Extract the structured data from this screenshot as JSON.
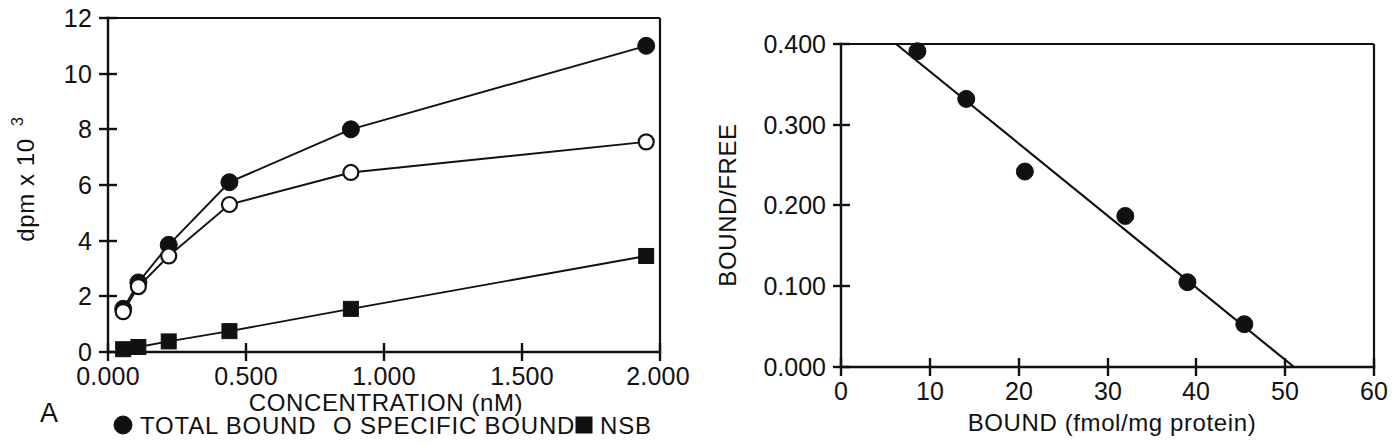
{
  "figure": {
    "panels": [
      {
        "letter": "A"
      },
      {
        "letter": "B"
      }
    ]
  },
  "panel_a": {
    "letter": "A",
    "axis": {
      "ylabel_main": "dpm x 10",
      "ylabel_sup": "3",
      "xlabel": "CONCENTRATION (nM)",
      "xticks": [
        "0.000",
        "0.500",
        "1.000",
        "1.500",
        "2.000"
      ],
      "yticks": [
        "0",
        "2",
        "4",
        "6",
        "8",
        "10",
        "12"
      ]
    },
    "legend": [
      {
        "marker": "filled-circle",
        "label": "TOTAL BOUND"
      },
      {
        "marker": "open-circle",
        "label": "O SPECIFIC BOUND"
      },
      {
        "marker": "filled-square",
        "label": "NSB"
      }
    ]
  },
  "panel_b": {
    "letter": "B",
    "axis": {
      "ylabel": "BOUND/FREE",
      "xlabel": "BOUND (fmol/mg protein)",
      "xticks": [
        "0",
        "10",
        "20",
        "30",
        "40",
        "50",
        "60"
      ],
      "yticks": [
        "0.000",
        "0.100",
        "0.200",
        "0.300",
        "0.400"
      ]
    }
  },
  "chart_data": [
    {
      "id": "panel-a",
      "type": "line",
      "title": "A",
      "xlabel": "CONCENTRATION (nM)",
      "ylabel": "dpm x 10^3",
      "xlim": [
        0.0,
        2.0
      ],
      "ylim": [
        0,
        12
      ],
      "xticks": [
        0.0,
        0.5,
        1.0,
        1.5,
        2.0
      ],
      "yticks": [
        0,
        2,
        4,
        6,
        8,
        10,
        12
      ],
      "grid": false,
      "legend_position": "below",
      "x": [
        0.055,
        0.11,
        0.22,
        0.44,
        0.88,
        1.95
      ],
      "series": [
        {
          "name": "TOTAL BOUND",
          "marker": "filled-circle",
          "values": [
            1.55,
            2.5,
            3.85,
            6.1,
            8.0,
            11.0
          ]
        },
        {
          "name": "SPECIFIC BOUND",
          "marker": "open-circle",
          "values": [
            1.45,
            2.35,
            3.45,
            5.3,
            6.45,
            7.55
          ]
        },
        {
          "name": "NSB",
          "marker": "filled-square",
          "values": [
            0.1,
            0.18,
            0.38,
            0.75,
            1.55,
            3.45
          ]
        }
      ]
    },
    {
      "id": "panel-b",
      "type": "scatter",
      "title": "B",
      "xlabel": "BOUND (fmol/mg protein)",
      "ylabel": "BOUND/FREE",
      "xlim": [
        0,
        60
      ],
      "ylim": [
        0.0,
        0.4
      ],
      "xticks": [
        0,
        10,
        20,
        30,
        40,
        50,
        60
      ],
      "yticks": [
        0.0,
        0.1,
        0.2,
        0.3,
        0.4
      ],
      "grid": false,
      "legend_position": "none",
      "points": [
        {
          "x": 8.6,
          "y": 0.391
        },
        {
          "x": 14.1,
          "y": 0.332
        },
        {
          "x": 20.7,
          "y": 0.242
        },
        {
          "x": 32.0,
          "y": 0.187
        },
        {
          "x": 39.0,
          "y": 0.105
        },
        {
          "x": 45.4,
          "y": 0.053
        }
      ],
      "fit_line": {
        "x_start": 6.2,
        "y_start": 0.4,
        "x_end": 51.0,
        "y_end": 0.0
      }
    }
  ]
}
